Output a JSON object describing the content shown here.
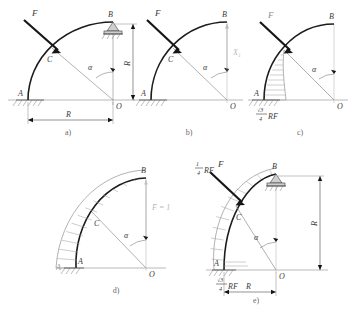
{
  "figure": {
    "colors": {
      "ink": "#1c1c1c",
      "ghost": "#a9a9a9",
      "diagram": "#909090",
      "dimension": "#4a4a4a"
    },
    "panels": [
      {
        "key": "a",
        "label": "a)",
        "caption": "Loaded arch with supports",
        "points": {
          "A": "A",
          "B": "B",
          "C": "C",
          "O": "O"
        },
        "force_label": "F",
        "angle_label": "α",
        "dim_horizontal": "R",
        "dim_vertical": "R",
        "support_A": "fixed-hatched",
        "support_B": "roller-pin"
      },
      {
        "key": "b",
        "label": "b)",
        "caption": "Primary system with redundant reaction",
        "points": {
          "A": "A",
          "B": "B",
          "C": "C",
          "O": "O"
        },
        "force_label": "F",
        "angle_label": "α",
        "reaction_label": "X₁"
      },
      {
        "key": "c",
        "label": "c)",
        "caption": "Bending moment diagram due to load F",
        "points": {
          "A": "A",
          "B": "B",
          "O": "O"
        },
        "force_label": "F",
        "angle_label": "α",
        "moment_value": {
          "numerator": "√3",
          "denominator": "4",
          "suffix": "RF"
        }
      },
      {
        "key": "d",
        "label": "d)",
        "caption": "Unit load bending moment diagram",
        "points": {
          "A": "A",
          "B": "B",
          "C": "C",
          "O": "O"
        },
        "angle_label": "α",
        "unit_load_label": "F̄ = 1"
      },
      {
        "key": "e",
        "label": "e)",
        "caption": "Combined moment diagram",
        "points": {
          "A": "A",
          "B": "B",
          "C": "C",
          "O": "O"
        },
        "force_label": "F",
        "angle_label": "α",
        "dim_horizontal": "R",
        "dim_vertical": "R",
        "moment_top": {
          "numerator": "1",
          "denominator": "4",
          "suffix": "RF"
        },
        "moment_bottom": {
          "numerator": "√3",
          "denominator": "4",
          "suffix": "RF"
        },
        "support_A": "fixed-hatched",
        "support_B": "roller-pin"
      }
    ]
  }
}
